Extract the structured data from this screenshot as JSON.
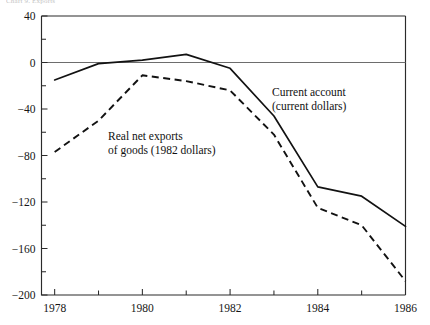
{
  "figure": {
    "top_fragment": "Chart 9. Exports"
  },
  "chart_data": {
    "type": "line",
    "title": "",
    "xlabel": "",
    "ylabel": "",
    "x": [
      1978,
      1979,
      1980,
      1981,
      1982,
      1983,
      1984,
      1985,
      1986
    ],
    "xlim": [
      1977.7,
      1986
    ],
    "ylim": [
      -200,
      40
    ],
    "grid": false,
    "zero_line": true,
    "legend_position": "inline-annotations",
    "xticks": [
      1978,
      1979,
      1980,
      1981,
      1982,
      1983,
      1984,
      1985,
      1986
    ],
    "xtick_labels": [
      "1978",
      "",
      "1980",
      "",
      "1982",
      "",
      "1984",
      "",
      "1986"
    ],
    "yticks": [
      40,
      20,
      0,
      -20,
      -40,
      -60,
      -80,
      -100,
      -120,
      -140,
      -160,
      -180,
      -200
    ],
    "ytick_labels": [
      "40",
      "",
      "0",
      "",
      "−40",
      "",
      "−80",
      "",
      "−120",
      "",
      "−160",
      "",
      "−200"
    ],
    "series": [
      {
        "name": "Current account (current dollars)",
        "style": "solid",
        "label_line1": "Current account",
        "label_line2": "(current dollars)",
        "values": [
          -15,
          -1,
          2,
          7,
          -5,
          -46,
          -107,
          -115,
          -141
        ]
      },
      {
        "name": "Real net exports of goods (1982 dollars)",
        "style": "dashed",
        "label_line1": "Real net exports",
        "label_line2": "of goods (1982 dollars)",
        "values": [
          -77,
          -50,
          -11,
          -16,
          -24,
          -62,
          -125,
          -140,
          -188
        ]
      }
    ],
    "colors": {
      "series_solid": "#121212",
      "series_dashed": "#121212",
      "axis": "#2b2b2b",
      "zero_line": "#6d6d6d",
      "background": "#ffffff"
    }
  }
}
